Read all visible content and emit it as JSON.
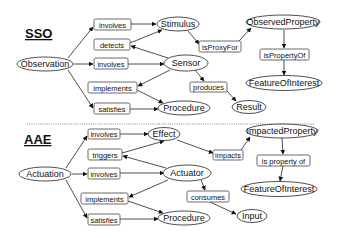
{
  "sections": {
    "sso": {
      "title": "SSO",
      "nodes": {
        "observation": "Observation",
        "stimulus": "Stimulus",
        "sensor": "Sensor",
        "procedure": "Procedure",
        "result": "Result",
        "observed_property": "ObservedProperty",
        "feature_of_interest": "FeatureOfInterest"
      },
      "relations": {
        "involves_1": "involves",
        "detects": "detects",
        "involves_2": "involves",
        "implements": "implements",
        "satisfies": "satisfies",
        "is_proxy_for": "isProxyFor",
        "produces": "produces",
        "is_property_of": "isPropertyOf"
      }
    },
    "aae": {
      "title": "AAE",
      "nodes": {
        "actuation": "Actuation",
        "effect": "Effect",
        "actuator": "Actuator",
        "procedure": "Procedure",
        "input": "Input",
        "impacted_property": "ImpactedProperty",
        "feature_of_interest": "FeatureOfInterest"
      },
      "relations": {
        "involves_1": "involves",
        "triggers": "triggers",
        "involves_2": "involves",
        "implements": "implements",
        "satisfies": "satisfies",
        "impacts": "impacts",
        "consumes": "consumes",
        "is_property_of": "is property of"
      }
    }
  }
}
